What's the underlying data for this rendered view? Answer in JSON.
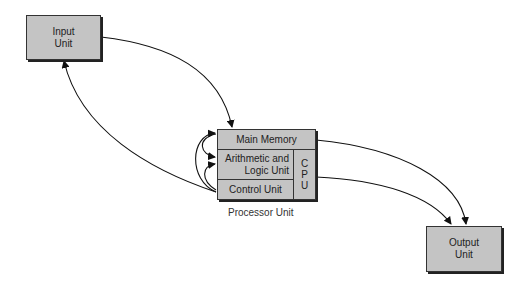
{
  "diagram": {
    "input_unit": {
      "label_line1": "Input",
      "label_line2": "Unit"
    },
    "output_unit": {
      "label_line1": "Output",
      "label_line2": "Unit"
    },
    "processor": {
      "main_memory": "Main Memory",
      "alu_line1": "Arithmetic and",
      "alu_line2": "Logic Unit",
      "control_unit": "Control Unit",
      "cpu_letters": [
        "C",
        "P",
        "U"
      ],
      "caption": "Processor Unit"
    },
    "colors": {
      "box_fill": "#c4c4c4",
      "stroke": "#222222"
    },
    "connections": [
      {
        "from": "Input Unit",
        "to": "Main Memory"
      },
      {
        "from": "Control Unit",
        "to": "Input Unit"
      },
      {
        "from": "Control Unit",
        "to": "Main Memory"
      },
      {
        "from": "Control Unit",
        "to": "Arithmetic and Logic Unit"
      },
      {
        "from": "Main Memory",
        "to": "Arithmetic and Logic Unit"
      },
      {
        "from": "Main Memory",
        "to": "Output Unit"
      },
      {
        "from": "Control Unit",
        "to": "Output Unit"
      }
    ]
  }
}
